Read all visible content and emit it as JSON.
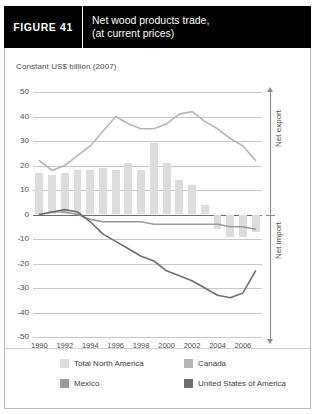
{
  "figure": {
    "number_label": "FIGURE  41",
    "title_line1": "Net wood products trade,",
    "title_line2": "(at current prices)"
  },
  "subtitle": "Constant US$ billion (2007)",
  "right_axis": {
    "upper_label": "Net export",
    "lower_label": "Net import"
  },
  "legend": {
    "items": [
      {
        "label": "Total North America",
        "color": "#dcdcdc"
      },
      {
        "label": "Canada",
        "color": "#b4b4b4"
      },
      {
        "label": "Mexico",
        "color": "#9a9a9a"
      },
      {
        "label": "United States of America",
        "color": "#6e6e6e"
      }
    ]
  },
  "chart_data": {
    "type": "bar",
    "title": "Net wood products trade, (at current prices)",
    "subtitle": "Constant US$ billion (2007)",
    "xlabel": "",
    "ylabel": "Constant US$ billion (2007)",
    "ylim": [
      -50,
      50
    ],
    "ytick_values": [
      50,
      40,
      30,
      20,
      10,
      0,
      -10,
      -20,
      -30,
      -40,
      -50
    ],
    "ytick_labels": [
      "50",
      "40",
      "30",
      "20",
      "10",
      "0",
      "-10",
      "-20",
      "-30",
      "-40",
      "-50"
    ],
    "grid": true,
    "legend_position": "bottom",
    "x": [
      1990,
      1991,
      1992,
      1993,
      1994,
      1995,
      1996,
      1997,
      1998,
      1999,
      2000,
      2001,
      2002,
      2003,
      2004,
      2005,
      2006,
      2007
    ],
    "xtick_labels": [
      "1990",
      "1992",
      "1994",
      "1996",
      "1998",
      "2000",
      "2002",
      "2004",
      "2006"
    ],
    "xtick_values": [
      1990,
      1992,
      1994,
      1996,
      1998,
      2000,
      2002,
      2004,
      2006
    ],
    "series": [
      {
        "name": "Total North America",
        "type": "bar",
        "color": "#dcdcdc",
        "values": [
          17,
          16,
          17,
          18,
          18,
          19,
          18,
          21,
          18,
          29,
          21,
          14,
          12,
          4,
          -6,
          -9,
          -9,
          -7
        ]
      },
      {
        "name": "Canada",
        "type": "line",
        "color": "#b4b4b4",
        "values": [
          22,
          18,
          20,
          24,
          28,
          34,
          40,
          37,
          35,
          35,
          37,
          41,
          42,
          38,
          35,
          31,
          28,
          22
        ]
      },
      {
        "name": "Mexico",
        "type": "line",
        "color": "#9a9a9a",
        "values": [
          0,
          1,
          1,
          0,
          -2,
          -3,
          -3,
          -3,
          -3,
          -4,
          -4,
          -4,
          -4,
          -4,
          -4,
          -5,
          -5,
          -6
        ]
      },
      {
        "name": "United States of America",
        "type": "line",
        "color": "#6e6e6e",
        "values": [
          0,
          1,
          2,
          1,
          -3,
          -8,
          -11,
          -14,
          -17,
          -19,
          -23,
          -25,
          -27,
          -30,
          -33,
          -34,
          -32,
          -23
        ]
      }
    ]
  }
}
